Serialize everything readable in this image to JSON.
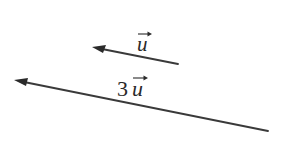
{
  "figure": {
    "vectors": [
      {
        "id": "u",
        "label": {
          "coefficient": "",
          "symbol": "u"
        },
        "scale": 1,
        "direction": "left-up"
      },
      {
        "id": "3u",
        "label": {
          "coefficient": "3",
          "symbol": "u"
        },
        "scale": 3,
        "direction": "left-up"
      }
    ],
    "colors": {
      "stroke": "#3a3a3a",
      "text": "#2a2a2a",
      "background": "#ffffff"
    }
  }
}
